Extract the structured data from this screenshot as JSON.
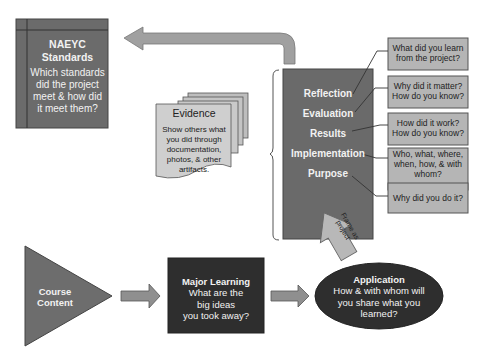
{
  "naeyc": {
    "title_line1": "NAEYC",
    "title_line2": "Standards",
    "question_line1": "Which standards",
    "question_line2": "did the project",
    "question_line3": "meet & how did",
    "question_line4": "it meet them?"
  },
  "evidence": {
    "title": "Evidence",
    "line1": "Show others what",
    "line2": "you did through",
    "line3": "documentation,",
    "line4": "photos, & other",
    "line5": "artifacts."
  },
  "project_stack": {
    "items": [
      {
        "label": "Reflection"
      },
      {
        "label": "Evaluation"
      },
      {
        "label": "Results"
      },
      {
        "label": "Implementation"
      },
      {
        "label": "Purpose"
      }
    ]
  },
  "questions": [
    {
      "line1": "What did you learn",
      "line2": "from the project?"
    },
    {
      "line1": "Why did it matter?",
      "line2": "How do you know?"
    },
    {
      "line1": "How did it work?",
      "line2": "How do you know?"
    },
    {
      "line1": "Who, what, where,",
      "line2": "when, how, & with",
      "line3": "whom?"
    },
    {
      "line1": "Why did you do it?"
    }
  ],
  "frame_arrow": {
    "line1": "Frame as",
    "line2": "project"
  },
  "course_content": {
    "line1": "Course",
    "line2": "Content"
  },
  "major_learning": {
    "title": "Major Learning",
    "line1": "What are the",
    "line2": "big ideas",
    "line3": "you took away?"
  },
  "application": {
    "title": "Application",
    "line1": "How & with whom will",
    "line2": "you share what you",
    "line3": "learned?"
  },
  "colors": {
    "dark_box": "#2f2f2f",
    "mid_box": "#6e6e6e",
    "light_box": "#b3b3b3",
    "arrow": "#9a9a9a"
  }
}
